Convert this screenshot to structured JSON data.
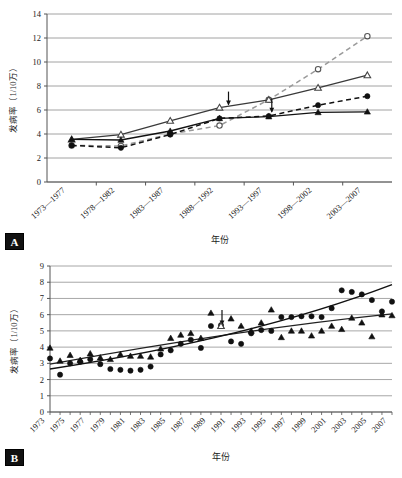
{
  "figure": {
    "panel_a_tag": "A",
    "panel_b_tag": "B"
  },
  "chart_data": [
    {
      "id": "panel_a",
      "type": "line",
      "title": "",
      "xlabel": "年份",
      "ylabel": "发病率（1/10万）",
      "categories": [
        "1973—1977",
        "1978—1982",
        "1983—1987",
        "1988—1992",
        "1993—1997",
        "1998—2002",
        "2003—2007"
      ],
      "ylim": [
        0,
        14
      ],
      "yticks": [
        0,
        2,
        4,
        6,
        8,
        10,
        12,
        14
      ],
      "grid": true,
      "legend_position": "none",
      "annotations": [
        {
          "name": "arrow-upper",
          "target_category": "1988—1992",
          "target_value": 6.6,
          "direction": "down"
        },
        {
          "name": "arrow-lower",
          "target_category": "1993—1997",
          "target_value": 5.5,
          "direction": "down"
        }
      ],
      "series": [
        {
          "name": "open-circle-dashed",
          "marker": "open-circle",
          "line": "dashed",
          "values": [
            3.05,
            3.0,
            4.0,
            4.7,
            6.85,
            9.4,
            12.15
          ]
        },
        {
          "name": "open-triangle-solid",
          "marker": "open-triangle",
          "line": "solid",
          "values": [
            3.55,
            3.95,
            5.1,
            6.2,
            6.85,
            7.85,
            8.9
          ]
        },
        {
          "name": "filled-circle-dashed",
          "marker": "filled-circle",
          "line": "dashed",
          "values": [
            3.05,
            2.85,
            3.95,
            5.3,
            5.5,
            6.4,
            7.15
          ]
        },
        {
          "name": "filled-triangle-solid",
          "marker": "filled-triangle",
          "line": "solid",
          "values": [
            3.55,
            3.5,
            4.25,
            5.3,
            5.45,
            5.8,
            5.85
          ]
        }
      ]
    },
    {
      "id": "panel_b",
      "type": "scatter",
      "title": "",
      "xlabel": "年份",
      "ylabel": "发病率（1/10万）",
      "ylim": [
        0,
        9
      ],
      "yticks": [
        0,
        1,
        2,
        3,
        4,
        5,
        6,
        7,
        8,
        9
      ],
      "xlim": [
        1973,
        2007
      ],
      "xticks": [
        1973,
        1975,
        1977,
        1979,
        1981,
        1983,
        1985,
        1987,
        1989,
        1991,
        1993,
        1995,
        1997,
        1999,
        2001,
        2003,
        2005,
        2007
      ],
      "grid": true,
      "legend_position": "none",
      "x": [
        1973,
        1974,
        1975,
        1976,
        1977,
        1978,
        1979,
        1980,
        1981,
        1982,
        1983,
        1984,
        1985,
        1986,
        1987,
        1988,
        1989,
        1990,
        1991,
        1992,
        1993,
        1994,
        1995,
        1996,
        1997,
        1998,
        1999,
        2000,
        2001,
        2002,
        2003,
        2004,
        2005,
        2006,
        2007
      ],
      "annotations": [
        {
          "name": "arrow-1990",
          "target_year": 1990,
          "target_value": 5.3,
          "direction": "down"
        }
      ],
      "series": [
        {
          "name": "filled-triangle",
          "marker": "filled-triangle",
          "values": [
            3.95,
            3.15,
            3.5,
            3.2,
            3.6,
            3.35,
            3.25,
            3.55,
            3.45,
            3.45,
            3.4,
            3.9,
            4.55,
            4.75,
            4.85,
            4.55,
            6.1,
            5.3,
            5.75,
            5.3,
            5.0,
            5.5,
            6.3,
            4.6,
            5.0,
            5.0,
            4.7,
            5.0,
            5.3,
            5.1,
            5.8,
            5.5,
            4.65,
            6.0,
            5.95
          ]
        },
        {
          "name": "filled-circle",
          "marker": "filled-circle",
          "values": [
            3.3,
            2.3,
            3.0,
            3.1,
            3.25,
            2.95,
            2.65,
            2.6,
            2.55,
            2.6,
            2.8,
            3.55,
            3.8,
            4.2,
            4.45,
            3.95,
            5.3,
            5.35,
            4.35,
            4.2,
            4.85,
            5.05,
            5.0,
            5.85,
            5.85,
            5.9,
            5.9,
            5.85,
            6.4,
            7.5,
            7.4,
            7.25,
            6.9,
            6.2,
            6.8
          ]
        }
      ],
      "trend_lines": [
        {
          "name": "trend-triangle-linear",
          "from": [
            1973,
            2.95
          ],
          "to": [
            2007,
            6.05
          ],
          "curve": "flattening"
        },
        {
          "name": "trend-circle-linear",
          "from": [
            1973,
            2.65
          ],
          "to": [
            2007,
            7.85
          ],
          "curve": "rising"
        }
      ]
    }
  ]
}
